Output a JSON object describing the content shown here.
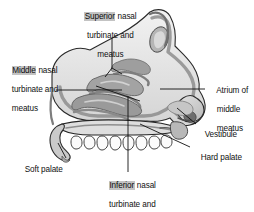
{
  "figure": {
    "background_color": "#ffffff",
    "line_color": "#1a1a1a",
    "fill_light": "#ededed",
    "fill_mid": "#cfcfcf",
    "fill_dark": "#a8a8a8",
    "highlight_color": "#c3c3c3"
  },
  "labels": {
    "superior": {
      "highlight_word": "Superior",
      "rest_line1": " nasal",
      "line2": "turbinate and",
      "line3": "meatus"
    },
    "middle": {
      "highlight_word": "Middle",
      "rest_line1": " nasal",
      "line2": "turbinate and",
      "line3": "meatus"
    },
    "inferior": {
      "highlight_word": "Inferior",
      "rest_line1": " nasal",
      "line2": "turbinate and",
      "line3": "meatus"
    },
    "atrium": {
      "line1": "Atrium of",
      "line2": "middle",
      "line3": "meatus"
    },
    "vestibule": {
      "line1": "Vestibule"
    },
    "hard_palate": {
      "line1": "Hard palate"
    },
    "soft_palate": {
      "line1": "Soft palate"
    }
  }
}
